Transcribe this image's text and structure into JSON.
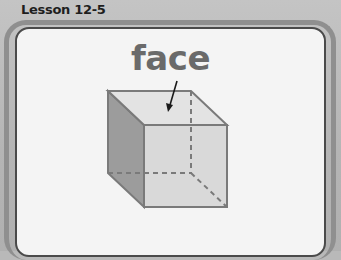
{
  "header": {
    "lesson_label": "Lesson 12-5"
  },
  "card": {
    "vocabulary_word": "face",
    "illustration": "cube-with-arrow-pointing-to-top-face"
  },
  "colors": {
    "background": "#b9b9b9",
    "card": "#f4f4f4",
    "word": "#6a6a6a",
    "cube_front": "#d9d9d9",
    "cube_top": "#e3e3e3",
    "cube_side": "#9c9c9c",
    "cube_edge": "#7a7a7a"
  }
}
